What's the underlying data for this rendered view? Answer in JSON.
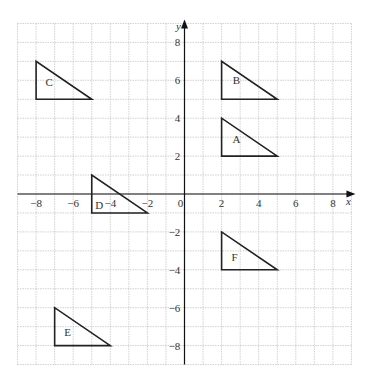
{
  "chart_data": {
    "type": "diagram",
    "title": "",
    "xlabel": "x",
    "ylabel": "y",
    "xlim": [
      -9,
      9
    ],
    "ylim": [
      -9,
      9
    ],
    "grid": true,
    "x_ticks": [
      -8,
      -6,
      -4,
      -2,
      0,
      2,
      4,
      6,
      8
    ],
    "y_ticks": [
      8,
      6,
      4,
      2,
      -2,
      -4,
      -6,
      -8
    ],
    "shapes": [
      {
        "name": "A",
        "vertices": [
          [
            2,
            4
          ],
          [
            2,
            2
          ],
          [
            5,
            2
          ]
        ],
        "label_pos": [
          2.8,
          2.9
        ]
      },
      {
        "name": "B",
        "vertices": [
          [
            2,
            7
          ],
          [
            2,
            5
          ],
          [
            5,
            5
          ]
        ],
        "label_pos": [
          2.8,
          6.0
        ]
      },
      {
        "name": "C",
        "vertices": [
          [
            -8,
            7
          ],
          [
            -8,
            5
          ],
          [
            -5,
            5
          ]
        ],
        "label_pos": [
          -7.3,
          5.9
        ]
      },
      {
        "name": "D",
        "vertices": [
          [
            -5,
            1
          ],
          [
            -5,
            -1
          ],
          [
            -2,
            -1
          ]
        ],
        "label_pos": [
          -4.6,
          -0.6
        ]
      },
      {
        "name": "E",
        "vertices": [
          [
            -7,
            -6
          ],
          [
            -7,
            -8
          ],
          [
            -4,
            -8
          ]
        ],
        "label_pos": [
          -6.3,
          -7.3
        ]
      },
      {
        "name": "F",
        "vertices": [
          [
            2,
            -2
          ],
          [
            2,
            -4
          ],
          [
            5,
            -4
          ]
        ],
        "label_pos": [
          2.7,
          -3.3
        ]
      }
    ]
  },
  "layout": {
    "x0px": 184.5,
    "y0px": 194,
    "xscale": 18.55,
    "yscale": 18.95
  }
}
